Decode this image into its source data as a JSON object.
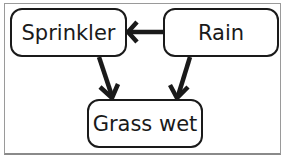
{
  "diagram": {
    "type": "bayesian-network",
    "nodes": [
      {
        "id": "sprinkler",
        "label": "Sprinkler"
      },
      {
        "id": "rain",
        "label": "Rain"
      },
      {
        "id": "grass_wet",
        "label": "Grass wet"
      }
    ],
    "edges": [
      {
        "from": "rain",
        "to": "sprinkler"
      },
      {
        "from": "sprinkler",
        "to": "grass_wet"
      },
      {
        "from": "rain",
        "to": "grass_wet"
      }
    ],
    "colors": {
      "stroke": "#1a1a1a",
      "background": "#ffffff",
      "frame": "#9a9a9a"
    }
  }
}
